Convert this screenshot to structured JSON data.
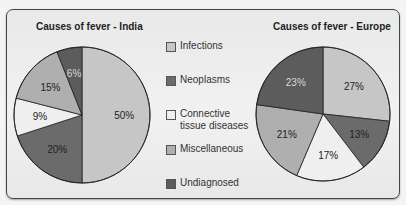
{
  "legend": [
    {
      "label": "Infections",
      "color": "#c6c6c6"
    },
    {
      "label": "Neoplasms",
      "color": "#6b6b6b"
    },
    {
      "label": "Connective\ntissue diseases",
      "line1": "Connective",
      "line2": "tissue diseases",
      "color": "#efefef"
    },
    {
      "label": "Miscellaneous",
      "color": "#afafaf"
    },
    {
      "label": "Undiagnosed",
      "color": "#5c5c5c"
    }
  ],
  "chart_data": [
    {
      "type": "pie",
      "title": "Causes of fever - India",
      "categories": [
        "Infections",
        "Neoplasms",
        "Connective tissue diseases",
        "Miscellaneous",
        "Undiagnosed"
      ],
      "values": [
        50,
        20,
        9,
        15,
        6
      ],
      "labels": [
        "50%",
        "20%",
        "9%",
        "15%",
        "6%"
      ],
      "start_angle": "12 o'clock, clockwise",
      "legend_position": "center (shared)"
    },
    {
      "type": "pie",
      "title": "Causes of fever - Europe",
      "categories": [
        "Infections",
        "Neoplasms",
        "Connective tissue diseases",
        "Miscellaneous",
        "Undiagnosed"
      ],
      "values": [
        27,
        13,
        17,
        21,
        23
      ],
      "labels": [
        "27%",
        "13%",
        "17%",
        "21%",
        "23%"
      ],
      "start_angle": "12 o'clock, clockwise",
      "legend_position": "center (shared)"
    }
  ]
}
